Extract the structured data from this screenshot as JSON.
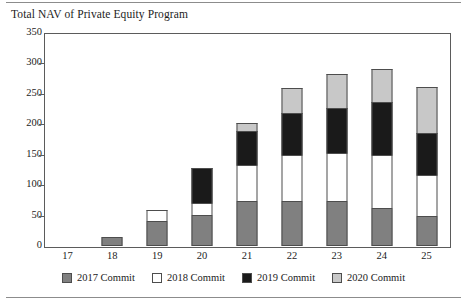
{
  "chart_data": {
    "type": "bar",
    "title": "Total NAV of Private Equity Program",
    "xlabel": "",
    "ylabel": "",
    "stacked": true,
    "grid": false,
    "legend_position": "bottom",
    "categories": [
      "17",
      "18",
      "19",
      "20",
      "21",
      "22",
      "23",
      "24",
      "25"
    ],
    "ylim": [
      0,
      350
    ],
    "yticks": [
      0,
      50,
      100,
      150,
      200,
      250,
      300,
      350
    ],
    "ytick_labels": [
      "0",
      "50",
      "100",
      "150",
      "200",
      "250",
      "300",
      "350"
    ],
    "series": [
      {
        "name": "2017 Commit",
        "color": "#808080",
        "values": [
          0,
          15,
          41,
          51,
          74,
          74,
          74,
          63,
          49
        ]
      },
      {
        "name": "2018 Commit",
        "color": "#ffffff",
        "values": [
          0,
          0,
          19,
          19,
          59,
          76,
          79,
          87,
          68
        ]
      },
      {
        "name": "2019 Commit",
        "color": "#1a1a1a",
        "values": [
          0,
          0,
          0,
          58,
          56,
          68,
          74,
          87,
          69
        ]
      },
      {
        "name": "2020 Commit",
        "color": "#c8c8c8",
        "values": [
          0,
          0,
          0,
          0,
          13,
          42,
          55,
          54,
          76
        ]
      }
    ],
    "totals": [
      0,
      15,
      60,
      128,
      202,
      260,
      282,
      291,
      262
    ]
  },
  "legend": {
    "items": [
      {
        "label": "2017 Commit",
        "color": "#808080"
      },
      {
        "label": "2018 Commit",
        "color": "#ffffff"
      },
      {
        "label": "2019 Commit",
        "color": "#1a1a1a"
      },
      {
        "label": "2020 Commit",
        "color": "#c8c8c8"
      }
    ]
  },
  "colors": {
    "axis": "#5b5b5b",
    "rule": "#8c8c8c",
    "text": "#1c1c1c",
    "background": "#ffffff"
  }
}
